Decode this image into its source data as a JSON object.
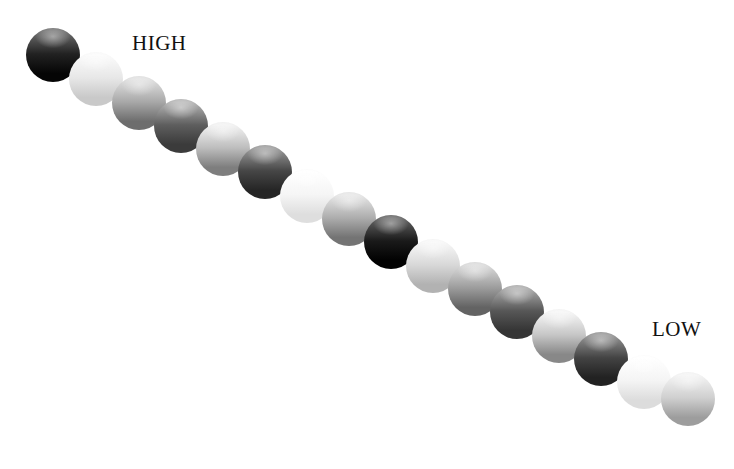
{
  "figure": {
    "background_color": "#ffffff",
    "width": 734,
    "height": 469
  },
  "labels": {
    "high": {
      "text": "HIGH",
      "x": 132,
      "y": 31,
      "font_size": 21
    },
    "low": {
      "text": "LOW",
      "x": 652,
      "y": 317,
      "font_size": 21
    }
  },
  "chart_data": {
    "type": "scatter",
    "xlabel": "",
    "ylabel": "",
    "grid": false,
    "legend": null,
    "annotations": [
      "HIGH",
      "LOW"
    ],
    "orientation": "diagonal descending left-to-right",
    "sphere_count": 16,
    "diameter": 54,
    "spacing_x": 42,
    "spacing_y": 23.5,
    "value_unit": "grayscale level 0-255 (top highlight / bottom shade)",
    "categories": [
      "1",
      "2",
      "3",
      "4",
      "5",
      "6",
      "7",
      "8",
      "9",
      "10",
      "11",
      "12",
      "13",
      "14",
      "15",
      "16"
    ],
    "values": [
      30,
      225,
      150,
      95,
      175,
      70,
      240,
      155,
      22,
      205,
      140,
      90,
      185,
      68,
      238,
      190
    ],
    "spheres": [
      {
        "index": 1,
        "cx": 53,
        "cy": 55,
        "d": 54,
        "top": "#6f6f6f",
        "mid": "#222222",
        "bottom": "#050505",
        "value": 30
      },
      {
        "index": 2,
        "cx": 96,
        "cy": 79,
        "d": 54,
        "top": "#fbfbfb",
        "mid": "#e7e7e7",
        "bottom": "#c9c9c9",
        "value": 225
      },
      {
        "index": 3,
        "cx": 139,
        "cy": 103,
        "d": 54,
        "top": "#e0e0e0",
        "mid": "#a8a8a8",
        "bottom": "#6d6d6d",
        "value": 150
      },
      {
        "index": 4,
        "cx": 181,
        "cy": 126,
        "d": 54,
        "top": "#b4b4b4",
        "mid": "#5e5e5e",
        "bottom": "#3b3b3b",
        "value": 95
      },
      {
        "index": 5,
        "cx": 223,
        "cy": 149,
        "d": 54,
        "top": "#f2f2f2",
        "mid": "#bdbdbd",
        "bottom": "#7e7e7e",
        "value": 175
      },
      {
        "index": 6,
        "cx": 265,
        "cy": 172,
        "d": 54,
        "top": "#9a9a9a",
        "mid": "#464646",
        "bottom": "#252525",
        "value": 70
      },
      {
        "index": 7,
        "cx": 307,
        "cy": 196,
        "d": 54,
        "top": "#ffffff",
        "mid": "#f5f5f5",
        "bottom": "#dedede",
        "value": 240
      },
      {
        "index": 8,
        "cx": 349,
        "cy": 219,
        "d": 54,
        "top": "#e6e6e6",
        "mid": "#adadad",
        "bottom": "#747474",
        "value": 155
      },
      {
        "index": 9,
        "cx": 391,
        "cy": 242,
        "d": 54,
        "top": "#636363",
        "mid": "#1a1a1a",
        "bottom": "#020202",
        "value": 22
      },
      {
        "index": 10,
        "cx": 433,
        "cy": 266,
        "d": 54,
        "top": "#f8f8f8",
        "mid": "#d8d8d8",
        "bottom": "#b2b2b2",
        "value": 205
      },
      {
        "index": 11,
        "cx": 475,
        "cy": 289,
        "d": 54,
        "top": "#dadada",
        "mid": "#9c9c9c",
        "bottom": "#636363",
        "value": 140
      },
      {
        "index": 12,
        "cx": 517,
        "cy": 312,
        "d": 54,
        "top": "#ababab",
        "mid": "#575757",
        "bottom": "#353535",
        "value": 90
      },
      {
        "index": 13,
        "cx": 559,
        "cy": 336,
        "d": 54,
        "top": "#f6f6f6",
        "mid": "#c6c6c6",
        "bottom": "#888888",
        "value": 185
      },
      {
        "index": 14,
        "cx": 601,
        "cy": 359,
        "d": 54,
        "top": "#949494",
        "mid": "#434343",
        "bottom": "#222222",
        "value": 68
      },
      {
        "index": 15,
        "cx": 644,
        "cy": 382,
        "d": 54,
        "top": "#ffffff",
        "mid": "#f4f4f4",
        "bottom": "#dcdcdc",
        "value": 238
      },
      {
        "index": 16,
        "cx": 688,
        "cy": 399,
        "d": 54,
        "top": "#f4f4f4",
        "mid": "#cfcfcf",
        "bottom": "#9d9d9d",
        "value": 190
      }
    ]
  }
}
